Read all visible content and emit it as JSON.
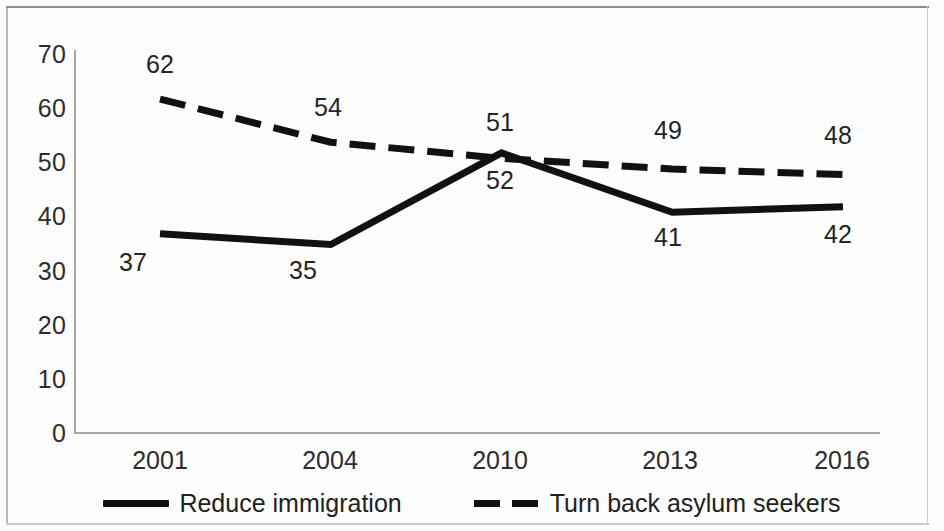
{
  "chart_data": {
    "type": "line",
    "title": "",
    "subtitle": "",
    "xlabel": "",
    "ylabel": "",
    "categories": [
      "2001",
      "2004",
      "2010",
      "2013",
      "2016"
    ],
    "ylim": [
      0,
      70
    ],
    "ytick_step": 10,
    "yticks": [
      "70",
      "60",
      "50",
      "40",
      "30",
      "20",
      "10",
      "0"
    ],
    "grid": false,
    "legend_position": "bottom",
    "series": [
      {
        "name": "Reduce immigration",
        "style": "solid",
        "color": "#111111",
        "values": [
          37,
          35,
          52,
          41,
          42
        ],
        "point_labels": [
          "37",
          "35",
          "52",
          "41",
          "42"
        ]
      },
      {
        "name": "Turn back asylum seekers",
        "style": "dashed",
        "color": "#111111",
        "values": [
          62,
          54,
          51,
          49,
          48
        ],
        "point_labels": [
          "62",
          "54",
          "51",
          "49",
          "48"
        ]
      }
    ]
  },
  "axis": {
    "y_ticks": [
      {
        "label": "70",
        "value": 70
      },
      {
        "label": "60",
        "value": 60
      },
      {
        "label": "50",
        "value": 50
      },
      {
        "label": "40",
        "value": 40
      },
      {
        "label": "30",
        "value": 30
      },
      {
        "label": "20",
        "value": 20
      },
      {
        "label": "10",
        "value": 10
      },
      {
        "label": "0",
        "value": 0
      }
    ],
    "x_ticks": [
      "2001",
      "2004",
      "2010",
      "2013",
      "2016"
    ]
  },
  "legend": {
    "items": [
      {
        "label": "Reduce immigration",
        "style": "solid"
      },
      {
        "label": "Turn back asylum seekers",
        "style": "dashed"
      }
    ]
  },
  "colors": {
    "line": "#111111",
    "axis": "#a6a6a6",
    "text": "#2d2d2d",
    "background": "#fdfdfd",
    "frame": "#b9b9b9"
  }
}
